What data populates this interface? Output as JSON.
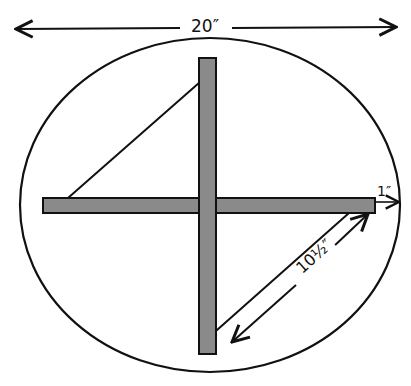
{
  "diagram": {
    "type": "kite-frame-plan",
    "colors": {
      "ink": "#111111",
      "stick_fill": "#8a8a8a",
      "background": "#ffffff"
    },
    "dimensions": {
      "overall_width": "20″",
      "stick_overhang": "1″",
      "diagonal_side": "10½″"
    },
    "elements": [
      {
        "id": "outer-ellipse",
        "shape": "ellipse"
      },
      {
        "id": "vertical-stick",
        "shape": "rect"
      },
      {
        "id": "horizontal-stick",
        "shape": "rect"
      },
      {
        "id": "diamond-string",
        "shape": "polygon",
        "vertices": 4
      }
    ]
  }
}
